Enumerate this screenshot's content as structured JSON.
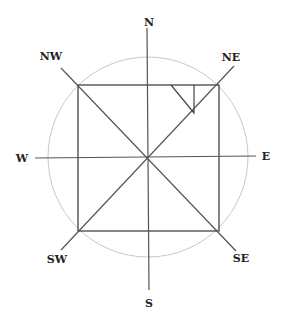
{
  "diagram": {
    "labels": {
      "n": "N",
      "ne": "NE",
      "e": "E",
      "se": "SE",
      "s": "S",
      "sw": "SW",
      "w": "W",
      "nw": "NW"
    },
    "colors": {
      "line": "#555555",
      "circle": "#c8c8c8",
      "text": "#222222",
      "background": "#ffffff"
    }
  }
}
